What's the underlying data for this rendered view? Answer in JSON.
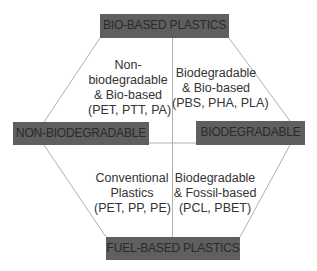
{
  "diagram": {
    "type": "hexagon-quadrant-classification",
    "colors": {
      "box_fill": "#5f5f5f",
      "box_text": "#2a2a2a",
      "line": "#b0b0b0",
      "label_text": "#333333",
      "background": "#ffffff"
    },
    "axes": {
      "top": "BIO-BASED PLASTICS",
      "bottom": "FUEL-BASED PLASTICS",
      "left": "NON-BIODEGRADABLE",
      "right": "BIODEGRADABLE"
    },
    "quadrants": {
      "top_left": {
        "lines": [
          "Non-",
          "biodegradable",
          "& Bio-based",
          "(PET, PTT, PA)"
        ]
      },
      "top_right": {
        "lines": [
          "Biodegradable",
          "& Bio-based",
          "(PBS, PHA, PLA)"
        ]
      },
      "bottom_left": {
        "lines": [
          "Conventional",
          "Plastics",
          "(PET, PP, PE)"
        ]
      },
      "bottom_right": {
        "lines": [
          "Biodegradable",
          "& Fossil-based",
          "(PCL, PBET)"
        ]
      }
    }
  }
}
